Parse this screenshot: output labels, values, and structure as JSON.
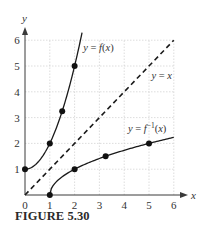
{
  "caption": "FIGURE 5.30",
  "chart_data": {
    "type": "line",
    "title": "",
    "xlabel": "x",
    "ylabel": "y",
    "xlim": [
      0,
      6
    ],
    "ylim": [
      0,
      6
    ],
    "grid": true,
    "xticks": [
      0,
      1,
      2,
      3,
      4,
      5,
      6
    ],
    "yticks": [
      1,
      2,
      3,
      4,
      5,
      6
    ],
    "series": [
      {
        "name": "y = f(x)",
        "style": "solid",
        "function": "x^2 + 1, x >= 0",
        "points": [
          [
            0,
            1
          ],
          [
            1,
            2
          ],
          [
            1.5,
            3.25
          ],
          [
            2,
            5
          ]
        ],
        "label": {
          "text_pre": "y = ",
          "text_fn": "f",
          "text_post": "(x)",
          "x": 2.35,
          "y": 5.6
        }
      },
      {
        "name": "y = x",
        "style": "dashed",
        "function": "x",
        "points": [
          [
            0,
            0
          ],
          [
            6,
            6
          ]
        ],
        "label": {
          "text_pre": "y = ",
          "text_fn": "x",
          "text_post": "",
          "x": 5.1,
          "y": 4.5
        }
      },
      {
        "name": "y = f^-1(x)",
        "style": "solid",
        "function": "sqrt(x - 1), x >= 1",
        "points": [
          [
            1,
            0
          ],
          [
            2,
            1
          ],
          [
            3.25,
            1.5
          ],
          [
            5,
            2
          ]
        ],
        "label": {
          "text_pre": "y = ",
          "text_fn": "f",
          "text_sup": "−1",
          "text_post": "(x)",
          "x": 4.15,
          "y": 2.45
        }
      }
    ]
  }
}
